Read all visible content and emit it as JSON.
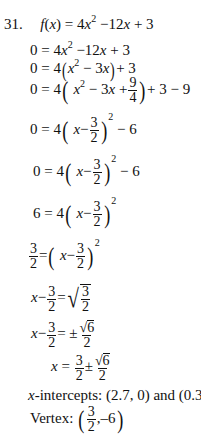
{
  "problem": {
    "number": "31.",
    "function_def": "f(x) = 4x² − 12x + 3"
  },
  "steps": [
    {
      "lhs": "0",
      "rhs": "4x² − 12x + 3"
    },
    {
      "lhs": "0",
      "rhs": "4(x² − 3x) + 3"
    },
    {
      "lhs": "0",
      "rhs": "4(x² − 3x + 9/4) + 3 − 9"
    },
    {
      "lhs": "0",
      "rhs": "4(x − 3/2)² − 6"
    },
    {
      "lhs": "0",
      "rhs": "4(x − 3/2)² − 6"
    },
    {
      "lhs": "6",
      "rhs": "4(x − 3/2)²"
    },
    {
      "lhs": "3/2",
      "rhs": "(x − 3/2)²"
    },
    {
      "lhs": "x − 3/2",
      "rhs": "√(3/2)"
    },
    {
      "lhs": "x − 3/2",
      "rhs": "±√6/2"
    },
    {
      "lhs": "x",
      "rhs": "3/2 ± √6/2"
    }
  ],
  "tokens": {
    "eq": "=",
    "zero": "0",
    "four": "4",
    "three": "3",
    "two": "2",
    "six": "6",
    "nine": "9",
    "x": "x",
    "minus": "−",
    "plus": "+",
    "pm": "±",
    "f": "f",
    "lp": "(",
    "rp": ")",
    "sq": "2",
    "term_12x": "12",
    "term_3x": "3",
    "tail_3_9": "+ 3 − 9",
    "minus6": "− 6",
    "plus3": "+ 3"
  },
  "results": {
    "x_intercepts_label": "x",
    "x_intercepts_text": "-intercepts: (2.7, 0) and (0.3, 0)",
    "vertex_label": "Vertex:",
    "vertex_x_num": "3",
    "vertex_x_den": "2",
    "vertex_y": ",–6"
  }
}
